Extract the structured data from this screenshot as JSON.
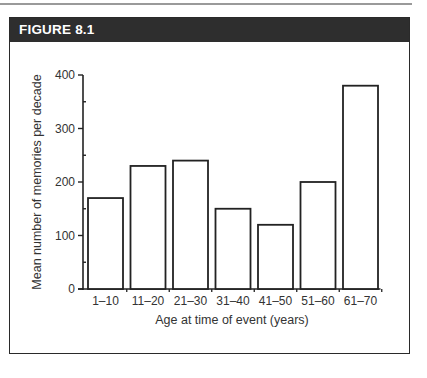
{
  "figure": {
    "label": "FIGURE 8.1"
  },
  "chart_data": {
    "type": "bar",
    "title": "FIGURE 8.1",
    "categories": [
      "1–10",
      "11–20",
      "21–30",
      "31–40",
      "41–50",
      "51–60",
      "61–70"
    ],
    "values": [
      170,
      230,
      240,
      150,
      120,
      200,
      380
    ],
    "xlabel": "Age at time of event (years)",
    "ylabel": "Mean number of memories per decade",
    "ylim": [
      0,
      400
    ],
    "yticks": [
      0,
      100,
      200,
      300,
      400
    ],
    "grid": false,
    "legend": null,
    "colors": {
      "bar_fill": "#ffffff",
      "bar_stroke": "#222222",
      "header_bg": "#2e2e2e",
      "header_text": "#ffffff"
    }
  }
}
